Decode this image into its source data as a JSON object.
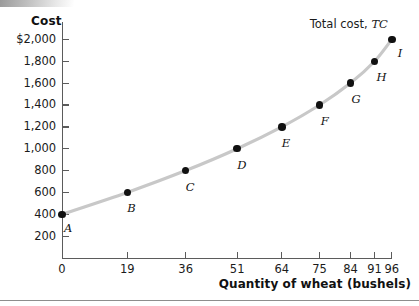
{
  "chart_data": {
    "type": "line",
    "title": "",
    "xlabel": "Quantity of wheat (bushels)",
    "ylabel": "Cost",
    "series_annotation_prefix": "Total cost, ",
    "series_annotation_symbol": "TC",
    "series_name": "Total cost, TC",
    "grid": false,
    "legend_position": "inline-right",
    "xlim": [
      0,
      103
    ],
    "ylim": [
      0,
      2100
    ],
    "x_ticks": [
      0,
      19,
      36,
      51,
      64,
      75,
      84,
      91,
      96
    ],
    "x_tick_labels": [
      "0",
      "19",
      "36",
      "51",
      "64",
      "75",
      "84",
      "91",
      "96"
    ],
    "y_ticks": [
      200,
      400,
      600,
      800,
      1000,
      1200,
      1400,
      1600,
      1800,
      2000
    ],
    "y_tick_labels": [
      "200",
      "400",
      "600",
      "800",
      "1,000",
      "1,200",
      "1,400",
      "1,600",
      "1,800",
      "$2,000"
    ],
    "points": [
      {
        "label": "A",
        "x": 0,
        "y": 400,
        "label_dx": 2,
        "label_dy": 13
      },
      {
        "label": "B",
        "x": 19,
        "y": 600,
        "label_dx": 0,
        "label_dy": 15
      },
      {
        "label": "C",
        "x": 36,
        "y": 800,
        "label_dx": 0,
        "label_dy": 15
      },
      {
        "label": "D",
        "x": 51,
        "y": 1000,
        "label_dx": 0,
        "label_dy": 15
      },
      {
        "label": "E",
        "x": 64,
        "y": 1200,
        "label_dx": 0,
        "label_dy": 15
      },
      {
        "label": "F",
        "x": 75,
        "y": 1400,
        "label_dx": 1,
        "label_dy": 15
      },
      {
        "label": "G",
        "x": 84,
        "y": 1600,
        "label_dx": 1,
        "label_dy": 15
      },
      {
        "label": "H",
        "x": 91,
        "y": 1800,
        "label_dx": 2,
        "label_dy": 15
      },
      {
        "label": "I",
        "x": 96,
        "y": 2000,
        "label_dx": 6,
        "label_dy": 13
      }
    ],
    "curve_color": "#c8c8c8",
    "point_color": "#111111",
    "axis_color": "#5b5b5b"
  }
}
